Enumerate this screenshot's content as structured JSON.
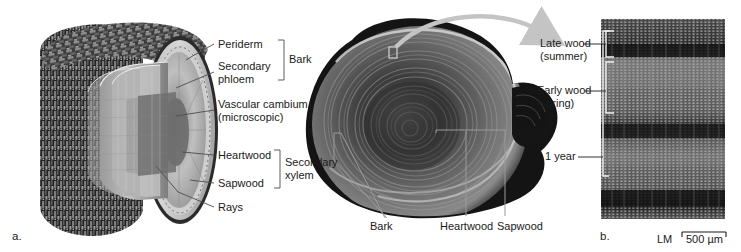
{
  "figure": {
    "background_color": "#ffffff",
    "panels": [
      {
        "letter": "a.",
        "description": "three-dimensional cut-away of a woody stem"
      },
      {
        "letter": "b.",
        "description": "light micrograph of wood in transverse section"
      }
    ]
  },
  "panel_a": {
    "letter": "a.",
    "labels": [
      {
        "id": "periderm",
        "text": "Periderm"
      },
      {
        "id": "secondary-phloem",
        "text": "Secondary\nphloem"
      },
      {
        "id": "vascular-cambium",
        "text": "Vascular cambium\n(microscopic)"
      },
      {
        "id": "heartwood",
        "text": "Heartwood"
      },
      {
        "id": "sapwood",
        "text": "Sapwood"
      },
      {
        "id": "rays",
        "text": "Rays"
      }
    ],
    "brackets": [
      {
        "id": "bark",
        "text": "Bark",
        "groups": [
          "Periderm",
          "Secondary phloem"
        ]
      },
      {
        "id": "secondary-xylem",
        "text": "Secondary\nxylem",
        "groups": [
          "Heartwood",
          "Sapwood"
        ]
      }
    ]
  },
  "panel_middle": {
    "labels": [
      {
        "id": "bark",
        "text": "Bark"
      },
      {
        "id": "heartwood",
        "text": "Heartwood"
      },
      {
        "id": "sapwood",
        "text": "Sapwood"
      }
    ],
    "arrow": {
      "id": "magnify-arrow",
      "color": "#bdbdbd",
      "from": "inset square on cross-section",
      "to": "micrograph panel b"
    },
    "inset_marker": {
      "id": "inset-square",
      "color": "#c8c8c8"
    }
  },
  "panel_b": {
    "letter": "b.",
    "labels": [
      {
        "id": "late-wood",
        "text": "Late wood\n(summer)"
      },
      {
        "id": "early-wood",
        "text": "Early wood\n(spring)"
      },
      {
        "id": "one-year",
        "text": "1 year"
      }
    ],
    "scale_bar": {
      "technique": "LM",
      "value": "500 µm"
    }
  },
  "colors": {
    "text": "#1a1a1a",
    "leader": "#4d4d4d",
    "leader_light": "#9a9a9a",
    "arrow": "#c0c0c0",
    "bracket_white": "#f2f2f2",
    "bark_dark": "#1c1c1c",
    "wood_mid": "#8a8a8a"
  }
}
